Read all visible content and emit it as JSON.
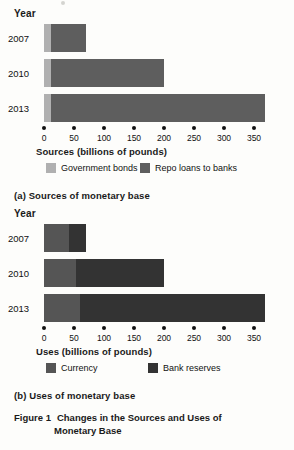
{
  "figure": {
    "number": "Figure 1",
    "title_line1": "Changes in the Sources and Uses of",
    "title_line2": "Monetary Base"
  },
  "colors": {
    "government_bonds": "#b0b0b0",
    "repo_loans": "#5e5e5e",
    "currency": "#555555",
    "bank_reserves": "#333333",
    "axis": "#111111",
    "background": "#fdfdfb"
  },
  "panel_a": {
    "caption": "(a) Sources of monetary base",
    "year_header": "Year",
    "axis_title": "Sources (billions of pounds)",
    "legend": [
      {
        "label": "Government bonds",
        "color": "#b0b0b0"
      },
      {
        "label": "Repo loans to banks",
        "color": "#5e5e5e"
      }
    ],
    "chart_data": {
      "type": "bar",
      "orientation": "horizontal",
      "stacked": true,
      "title": "Sources of monetary base",
      "xlabel": "Sources (billions of pounds)",
      "ylabel": "Year",
      "xlim": [
        0,
        350
      ],
      "xticks": [
        0,
        50,
        100,
        150,
        200,
        250,
        300,
        350
      ],
      "categories": [
        "2007",
        "2010",
        "2013"
      ],
      "series": [
        {
          "name": "Government bonds",
          "color": "#b0b0b0",
          "values": [
            12,
            12,
            12
          ]
        },
        {
          "name": "Repo loans to banks",
          "color": "#5e5e5e",
          "values": [
            58,
            188,
            356
          ]
        }
      ],
      "totals": [
        70,
        200,
        368
      ],
      "grid": false,
      "legend_position": "bottom"
    }
  },
  "panel_b": {
    "caption": "(b) Uses of monetary base",
    "year_header": "Year",
    "axis_title": "Uses (billions of pounds)",
    "legend": [
      {
        "label": "Currency",
        "color": "#555555"
      },
      {
        "label": "Bank reserves",
        "color": "#333333"
      }
    ],
    "chart_data": {
      "type": "bar",
      "orientation": "horizontal",
      "stacked": true,
      "title": "Uses of monetary base",
      "xlabel": "Uses (billions of pounds)",
      "ylabel": "Year",
      "xlim": [
        0,
        350
      ],
      "xticks": [
        0,
        50,
        100,
        150,
        200,
        250,
        300,
        350
      ],
      "categories": [
        "2007",
        "2010",
        "2013"
      ],
      "series": [
        {
          "name": "Currency",
          "color": "#555555",
          "values": [
            42,
            53,
            60
          ]
        },
        {
          "name": "Bank reserves",
          "color": "#333333",
          "values": [
            28,
            147,
            308
          ]
        }
      ],
      "totals": [
        70,
        200,
        368
      ],
      "grid": false,
      "legend_position": "bottom"
    }
  }
}
